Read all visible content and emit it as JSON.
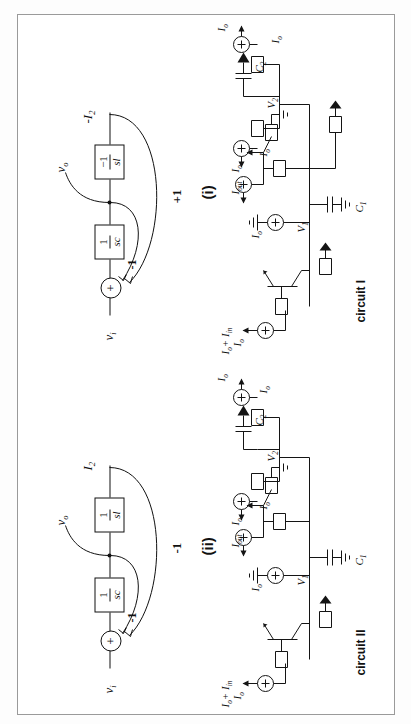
{
  "figure": {
    "orientation": "rotated-90-ccw",
    "panels": [
      {
        "id": "panel-i",
        "index_label": "(i)",
        "caption": "circuit I",
        "block_diagram": {
          "input_label": "v",
          "input_sub": "i",
          "output_label": "v",
          "output_sub": "o",
          "current_label": "-I",
          "current_sub": "2",
          "summer_sign": "+",
          "inner_feedback_gain": "-1",
          "outer_feedback_gain": "+1",
          "blocks": [
            {
              "name": "integrator-c",
              "numerator": "1",
              "denominator": "sc"
            },
            {
              "name": "integrator-l",
              "numerator": "−1",
              "denominator": "sl"
            }
          ]
        },
        "circuit_labels": [
          {
            "name": "input-current-source",
            "text": "I",
            "sub": "o",
            "extra": "+ I",
            "extra_sub": "in"
          },
          {
            "name": "node-v1",
            "text": "V",
            "sub": "1"
          },
          {
            "name": "cap-c1",
            "text": "C",
            "sub": "1"
          },
          {
            "name": "bias-io-1",
            "text": "I",
            "sub": "o"
          },
          {
            "name": "bias-io-2",
            "text": "I",
            "sub": "o"
          },
          {
            "name": "output-current",
            "text": "I",
            "sub": "out"
          },
          {
            "name": "bias-io-3",
            "text": "I",
            "sub": "o"
          },
          {
            "name": "node-v2",
            "text": "V",
            "sub": "2"
          },
          {
            "name": "cap-c2",
            "text": "C",
            "sub": "2"
          },
          {
            "name": "bias-io-4",
            "text": "I",
            "sub": "o"
          },
          {
            "name": "bias-io-5",
            "text": "I",
            "sub": "o"
          },
          {
            "name": "bias-io-6",
            "text": "I",
            "sub": "o"
          }
        ]
      },
      {
        "id": "panel-ii",
        "index_label": "(ii)",
        "caption": "circuit II",
        "block_diagram": {
          "input_label": "v",
          "input_sub": "i",
          "output_label": "v",
          "output_sub": "o",
          "current_label": "I",
          "current_sub": "2",
          "summer_sign": "+",
          "inner_feedback_gain": "-1",
          "outer_feedback_gain": "-1",
          "blocks": [
            {
              "name": "integrator-c",
              "numerator": "1",
              "denominator": "sc"
            },
            {
              "name": "integrator-l",
              "numerator": "1",
              "denominator": "sl"
            }
          ]
        },
        "circuit_labels": [
          {
            "name": "input-current-source",
            "text": "I",
            "sub": "o",
            "extra": "+ I",
            "extra_sub": "in"
          },
          {
            "name": "node-v1",
            "text": "V",
            "sub": "1"
          },
          {
            "name": "cap-c1",
            "text": "C",
            "sub": "1"
          },
          {
            "name": "bias-io-1",
            "text": "I",
            "sub": "o"
          },
          {
            "name": "bias-io-2",
            "text": "I",
            "sub": "o"
          },
          {
            "name": "output-current",
            "text": "I",
            "sub": "out"
          },
          {
            "name": "bias-io-3",
            "text": "I",
            "sub": "o"
          },
          {
            "name": "node-v2",
            "text": "V",
            "sub": "2"
          },
          {
            "name": "cap-c2",
            "text": "C",
            "sub": "2"
          },
          {
            "name": "bias-io-4",
            "text": "I",
            "sub": "o"
          },
          {
            "name": "bias-io-5",
            "text": "I",
            "sub": "o"
          },
          {
            "name": "bias-io-6",
            "text": "I",
            "sub": "o"
          }
        ]
      }
    ]
  },
  "colors": {
    "ink": "#141414",
    "frame": "#9a9a9a",
    "paper": "#ffffff"
  }
}
